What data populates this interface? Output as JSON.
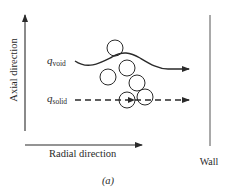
{
  "diagram": {
    "axes": {
      "vertical_label": "Axial direction",
      "horizontal_label": "Radial direction"
    },
    "flows": {
      "void": {
        "symbol": "q",
        "subscript": "void",
        "style": "solid-wavy"
      },
      "solid": {
        "symbol": "q",
        "subscript": "solid",
        "style": "dashed"
      }
    },
    "wall_label": "Wall",
    "caption": "(a)",
    "particles": [
      {
        "cx": 115,
        "cy": 48,
        "r": 8
      },
      {
        "cx": 108,
        "cy": 77,
        "r": 8
      },
      {
        "cx": 127,
        "cy": 68,
        "r": 8
      },
      {
        "cx": 137,
        "cy": 83,
        "r": 8
      },
      {
        "cx": 145,
        "cy": 97,
        "r": 8
      },
      {
        "cx": 127,
        "cy": 100,
        "r": 8
      }
    ],
    "colors": {
      "ink": "#2a2a2a",
      "background": "#ffffff"
    }
  }
}
